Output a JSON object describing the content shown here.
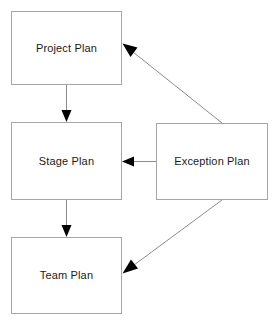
{
  "diagram": {
    "background_color": "#ffffff",
    "box_border_color": "#a6a6a6",
    "edge_color": "#8c8c8c",
    "arrowhead_color": "#000000",
    "text_color": "#1a1a1a",
    "nodes": [
      {
        "id": "project-plan",
        "label": "Project Plan",
        "x": 11,
        "y": 11,
        "width": 111,
        "height": 74
      },
      {
        "id": "stage-plan",
        "label": "Stage Plan",
        "x": 11,
        "y": 122,
        "width": 111,
        "height": 78
      },
      {
        "id": "team-plan",
        "label": "Team Plan",
        "x": 11,
        "y": 237,
        "width": 111,
        "height": 77
      },
      {
        "id": "exception-plan",
        "label": "Exception Plan",
        "x": 156,
        "y": 123,
        "width": 112,
        "height": 77
      }
    ],
    "edges": [
      {
        "id": "project-to-stage",
        "from": "project-plan",
        "to": "stage-plan",
        "style": "vertical-arrow"
      },
      {
        "id": "stage-to-team",
        "from": "stage-plan",
        "to": "team-plan",
        "style": "vertical-arrow"
      },
      {
        "id": "exception-to-stage",
        "from": "exception-plan",
        "to": "stage-plan",
        "style": "horizontal-arrow"
      },
      {
        "id": "exception-to-project",
        "from": "exception-plan",
        "to": "project-plan",
        "style": "diagonal-arrow"
      },
      {
        "id": "exception-to-team",
        "from": "exception-plan",
        "to": "team-plan",
        "style": "diagonal-arrow"
      }
    ]
  }
}
